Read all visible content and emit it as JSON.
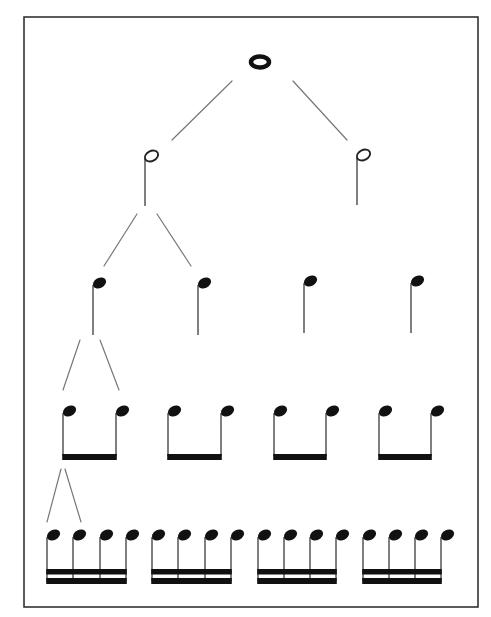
{
  "diagram": {
    "title": "Note value subdivision tree",
    "colors": {
      "ink": "#111111",
      "line": "#777777",
      "frame": "#333333",
      "background": "#ffffff"
    },
    "frame": {
      "x": 24,
      "y": 17,
      "w": 454,
      "h": 590
    },
    "levels": [
      {
        "name": "whole",
        "label": "Whole note",
        "count": 1
      },
      {
        "name": "half",
        "label": "Half notes",
        "count": 2
      },
      {
        "name": "quarter",
        "label": "Quarter notes",
        "count": 4
      },
      {
        "name": "eighth",
        "label": "Eighth notes (beamed pairs)",
        "count": 8
      },
      {
        "name": "sixteenth",
        "label": "Sixteenth notes (beamed groups of four)",
        "count": 16
      }
    ],
    "whole_note": {
      "cx": 260,
      "cy": 62
    },
    "half_notes": [
      {
        "stem_x": 145,
        "head_y": 156,
        "stem_bottom": 206
      },
      {
        "stem_x": 357,
        "head_y": 155,
        "stem_bottom": 205
      }
    ],
    "quarter_notes": [
      {
        "stem_x": 93,
        "head_y": 283,
        "stem_bottom": 335
      },
      {
        "stem_x": 198,
        "head_y": 283,
        "stem_bottom": 335
      },
      {
        "stem_x": 304,
        "head_y": 281,
        "stem_bottom": 333
      },
      {
        "stem_x": 411,
        "head_y": 281,
        "stem_bottom": 333
      }
    ],
    "eighth_groups": [
      {
        "stems": [
          63,
          116
        ],
        "head_y": 411,
        "beam_y": 454
      },
      {
        "stems": [
          168,
          221
        ],
        "head_y": 411,
        "beam_y": 454
      },
      {
        "stems": [
          274,
          326
        ],
        "head_y": 411,
        "beam_y": 454
      },
      {
        "stems": [
          379,
          431
        ],
        "head_y": 411,
        "beam_y": 454
      }
    ],
    "sixteenth_groups": [
      {
        "stems": [
          47,
          73,
          100,
          126
        ],
        "head_y": 535,
        "beam1_y": 569,
        "beam2_y": 578
      },
      {
        "stems": [
          152,
          178,
          205,
          231
        ],
        "head_y": 535,
        "beam1_y": 569,
        "beam2_y": 578
      },
      {
        "stems": [
          258,
          284,
          310,
          336
        ],
        "head_y": 535,
        "beam1_y": 569,
        "beam2_y": 578
      },
      {
        "stems": [
          363,
          389,
          415,
          441
        ],
        "head_y": 535,
        "beam1_y": 569,
        "beam2_y": 578
      }
    ],
    "connectors": [
      {
        "from": "whole",
        "to": "half-1",
        "x1": 232,
        "y1": 81,
        "x2": 172,
        "y2": 140
      },
      {
        "from": "whole",
        "to": "half-2",
        "x1": 293,
        "y1": 81,
        "x2": 347,
        "y2": 140
      },
      {
        "from": "half-1",
        "to": "quarter-1",
        "x1": 137,
        "y1": 214,
        "x2": 104,
        "y2": 266
      },
      {
        "from": "half-1",
        "to": "quarter-2",
        "x1": 157,
        "y1": 214,
        "x2": 191,
        "y2": 266
      },
      {
        "from": "quarter-1",
        "to": "eighth-1",
        "x1": 80,
        "y1": 340,
        "x2": 63,
        "y2": 390
      },
      {
        "from": "quarter-1",
        "to": "eighth-2",
        "x1": 100,
        "y1": 340,
        "x2": 119,
        "y2": 390
      },
      {
        "from": "eighth-1",
        "to": "sixteenth-1",
        "x1": 61,
        "y1": 469,
        "x2": 47,
        "y2": 522
      },
      {
        "from": "eighth-1",
        "to": "sixteenth-2",
        "x1": 65,
        "y1": 469,
        "x2": 81,
        "y2": 522
      }
    ]
  }
}
